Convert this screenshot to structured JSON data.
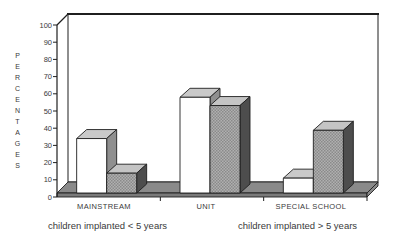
{
  "chart_data": {
    "type": "bar",
    "variant": "3d-column",
    "title": "",
    "xlabel": "",
    "ylabel": "PERCENTAGES",
    "categories": [
      "MAINSTREAM",
      "UNIT",
      "SPECIAL SCHOOL"
    ],
    "series": [
      {
        "name": "children implanted < 5 years",
        "fill": "white",
        "values": [
          33,
          58,
          9
        ]
      },
      {
        "name": "children implanted > 5 years",
        "fill": "gray-pattern",
        "values": [
          12,
          53,
          38
        ]
      }
    ],
    "yticks": [
      0,
      10,
      20,
      30,
      40,
      50,
      60,
      70,
      80,
      90,
      100
    ],
    "ylim": [
      0,
      100
    ],
    "grid": false,
    "legend_position": "below-x-axis"
  },
  "colors": {
    "background": "#ffffff",
    "outline": "#1f1f1f",
    "text": "#3a3a3a",
    "wall": "#ffffff",
    "floor_top": "#8a8a8a",
    "floor_front": "#7a7a7a",
    "white_bar_front": "#ffffff",
    "white_bar_top": "#c9c9c9",
    "white_bar_side": "#8f8f8f",
    "gray_bar_front_a": "#b0b0b0",
    "gray_bar_front_b": "#8a8a8a",
    "gray_bar_top": "#c4c4c4",
    "gray_bar_side": "#4d4d4d"
  }
}
